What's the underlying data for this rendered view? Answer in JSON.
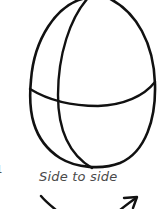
{
  "diagram": {
    "caption": "Side to side",
    "edge_fragment": "1",
    "colors": {
      "stroke": "#111111",
      "caption": "#4a4a4a",
      "background": "#ffffff"
    },
    "elements": [
      {
        "name": "egg-outline",
        "type": "ellipse-outline"
      },
      {
        "name": "horizontal-guide",
        "type": "curve"
      },
      {
        "name": "vertical-guide",
        "type": "curve"
      },
      {
        "name": "rotation-arrow",
        "type": "arrow",
        "direction": "side-to-side"
      }
    ]
  }
}
